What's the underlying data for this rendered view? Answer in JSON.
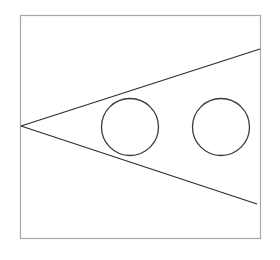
{
  "diagram": {
    "background": "#ffffff",
    "frame": {
      "x": 20.5,
      "y": 15.5,
      "width": 240,
      "height": 223,
      "stroke": "#a8a8a8",
      "stroke_width": 1.2
    },
    "wedge": {
      "apex": {
        "x": 21,
        "y": 126
      },
      "upper_end": {
        "x": 260,
        "y": 49
      },
      "lower_end": {
        "x": 257,
        "y": 204
      },
      "stroke": "#2f2f2f",
      "stroke_width": 1.3
    },
    "circles": [
      {
        "name": "circle-inside-wedge",
        "cx": 130,
        "cy": 127,
        "r": 28.5
      },
      {
        "name": "circle-right",
        "cx": 221,
        "cy": 127,
        "r": 28.5
      }
    ],
    "circle_stroke": "#3a3a3a",
    "circle_stroke_width": 1.3
  }
}
